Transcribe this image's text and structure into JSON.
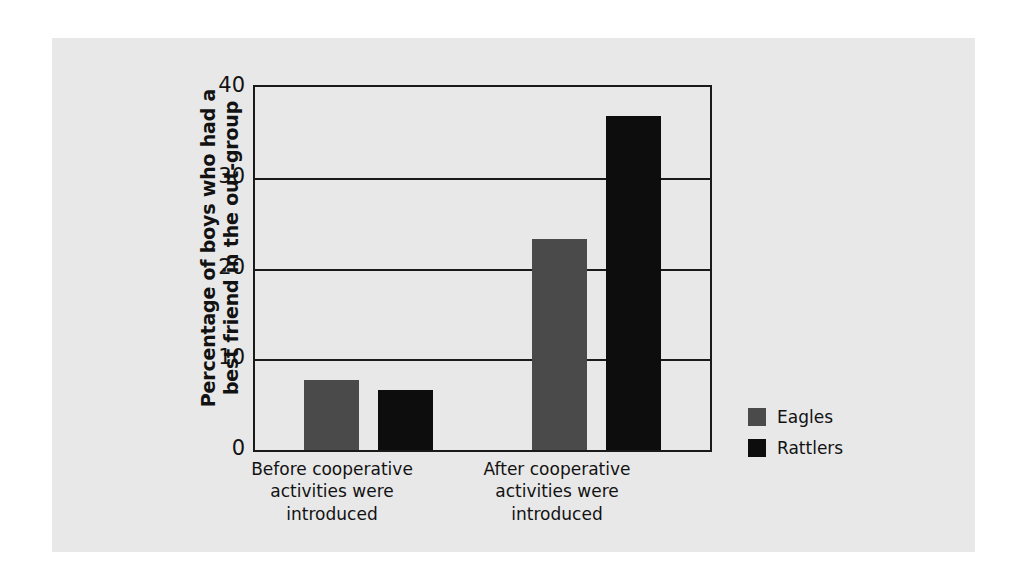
{
  "chart_data": {
    "type": "bar",
    "title": "",
    "subtitle": "",
    "xlabel": "",
    "ylabel": "Percentage of boys who had a\nbest friend in the out-group",
    "ylabel_line1": "Percentage of boys who had a",
    "ylabel_line2": "best friend in the out-group",
    "categories": [
      "Before cooperative\nactivities were\nintroduced",
      "After cooperative\nactivities were\nintroduced"
    ],
    "series": [
      {
        "name": "Eagles",
        "color": "#4a4a4a",
        "values": [
          7.7,
          23.3
        ]
      },
      {
        "name": "Rattlers",
        "color": "#0d0d0d",
        "values": [
          6.6,
          36.8
        ]
      }
    ],
    "ylim": [
      0,
      40
    ],
    "yticks": [
      0,
      10,
      20,
      30,
      40
    ],
    "ytick_labels": [
      "0",
      "10",
      "20",
      "30",
      "40"
    ],
    "grid": true,
    "grid_axis": "y",
    "legend_position": "right",
    "background_color": "#e8e8e8",
    "axis_color": "#1a1a1a"
  },
  "legend": {
    "entries": [
      {
        "label": "Eagles"
      },
      {
        "label": "Rattlers"
      }
    ]
  }
}
